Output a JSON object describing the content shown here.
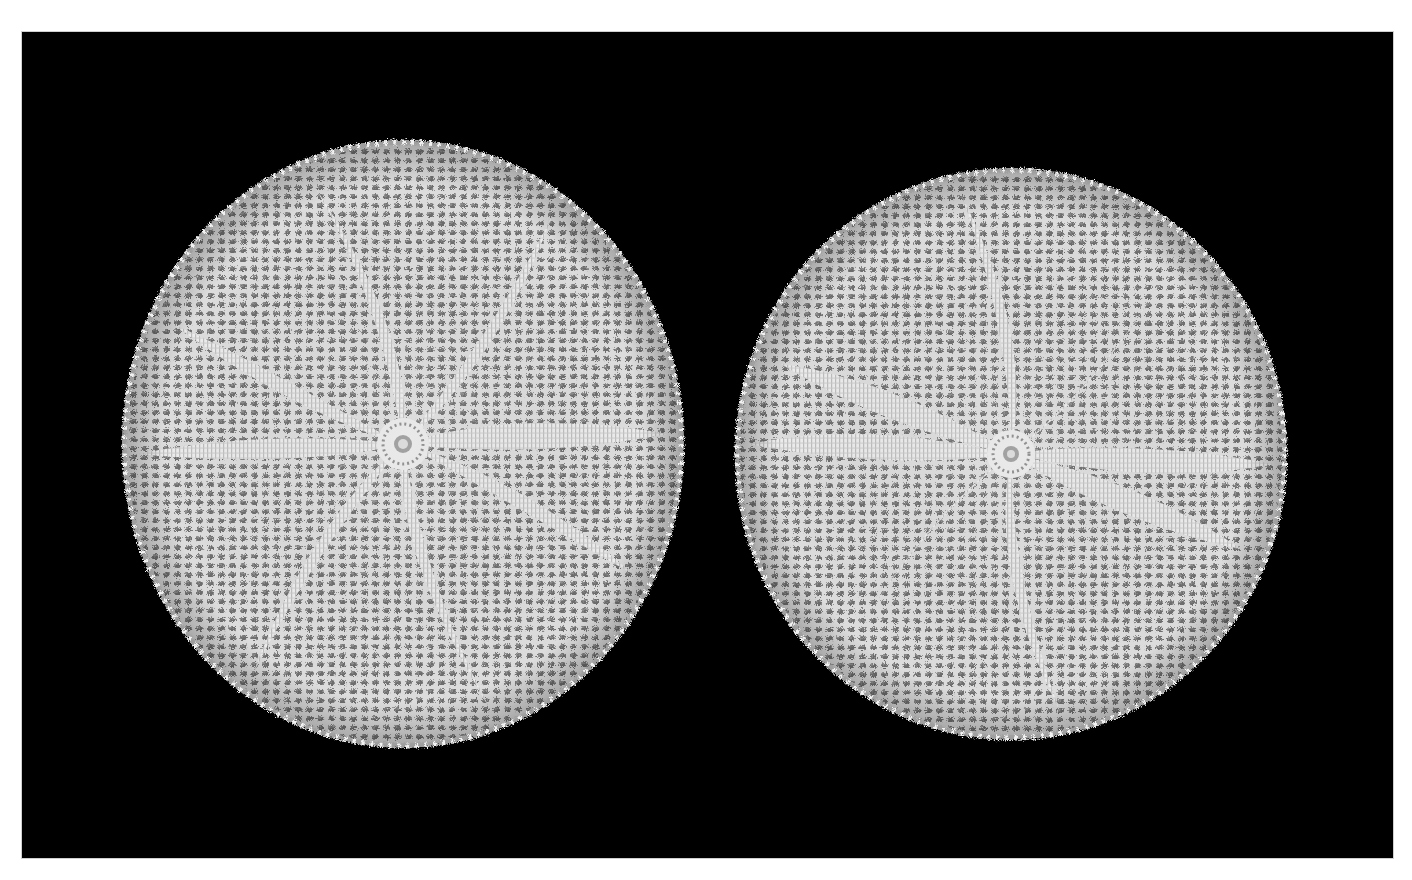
{
  "caption": {
    "text": "",
    "note_visible": "cropped caption line, only descenders visible"
  },
  "photo": {
    "subject": "two round crocheted doilies on black background",
    "background_color": "#000000",
    "thread_color": "#e4e4e4",
    "shadow_color": "#6e6e6e",
    "doilies": [
      {
        "label": "left-doily",
        "cx": 381,
        "cy": 412,
        "rx": 281,
        "ry": 304,
        "petals": 8
      },
      {
        "label": "right-doily",
        "cx": 989,
        "cy": 422,
        "rx": 276,
        "ry": 286,
        "petals": 8
      }
    ]
  }
}
